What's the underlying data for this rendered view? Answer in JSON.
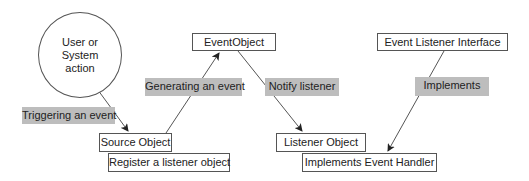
{
  "diagram": {
    "start_node": {
      "line1": "User or",
      "line2": "System",
      "line3": "action"
    },
    "nodes": {
      "source_object": "Source Object",
      "register_listener": "Register a listener object",
      "event_object": "EventObject",
      "listener_object": "Listener Object",
      "implements_handler": "Implements Event Handler",
      "listener_interface": "Event Listener Interface"
    },
    "edge_labels": {
      "triggering": "Triggering an event",
      "generating": "Generating an event",
      "notify": "Notify listener",
      "implements": "Implements"
    },
    "colors": {
      "label_fill": "#bdbdbd",
      "line": "#555555"
    }
  }
}
